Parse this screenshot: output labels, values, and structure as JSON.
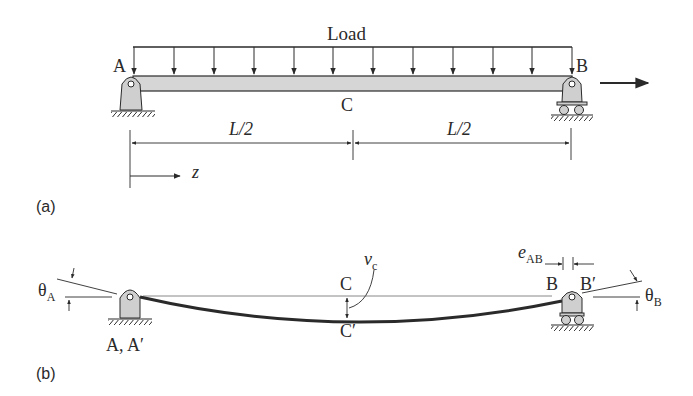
{
  "figure": {
    "part_a": {
      "panel_label": "(a)",
      "load_label": "Load",
      "point_a": "A",
      "point_b": "B",
      "point_c": "C",
      "span_left": "L/2",
      "span_right": "L/2",
      "axis_label": "z",
      "load_arrow_count": 12
    },
    "part_b": {
      "panel_label": "(b)",
      "theta_a": "θ",
      "theta_a_sub": "A",
      "theta_b": "θ",
      "theta_b_sub": "B",
      "support_a": "A, A′",
      "point_c": "C",
      "point_c_prime": "C′",
      "deflection": "v",
      "deflection_sub": "c",
      "point_b": "B",
      "point_b_prime": "B′",
      "shortening": "e",
      "shortening_sub": "AB"
    },
    "colors": {
      "ink": "#2a2a2a",
      "beam_fill": "#d6d6d6",
      "support_fill": "#cfcfcf"
    }
  }
}
